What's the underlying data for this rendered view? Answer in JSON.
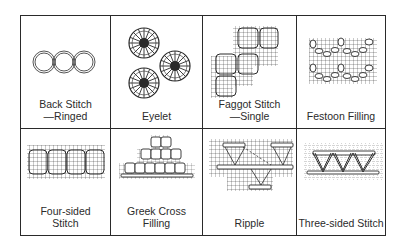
{
  "diagram": {
    "cells": [
      {
        "id": "back-stitch-ringed",
        "label": "Back Stitch\n—Ringed"
      },
      {
        "id": "eyelet",
        "label": "Eyelet"
      },
      {
        "id": "faggot-stitch-single",
        "label": "Faggot Stitch\n—Single"
      },
      {
        "id": "festoon-filling",
        "label": "Festoon Filling"
      },
      {
        "id": "four-sided-stitch",
        "label": "Four-sided\nStitch"
      },
      {
        "id": "greek-cross-filling",
        "label": "Greek Cross\nFilling"
      },
      {
        "id": "ripple",
        "label": "Ripple"
      },
      {
        "id": "three-sided-stitch",
        "label": "Three-sided Stitch"
      }
    ],
    "colors": {
      "ink": "#2a2a2a",
      "paper": "#ffffff"
    }
  }
}
